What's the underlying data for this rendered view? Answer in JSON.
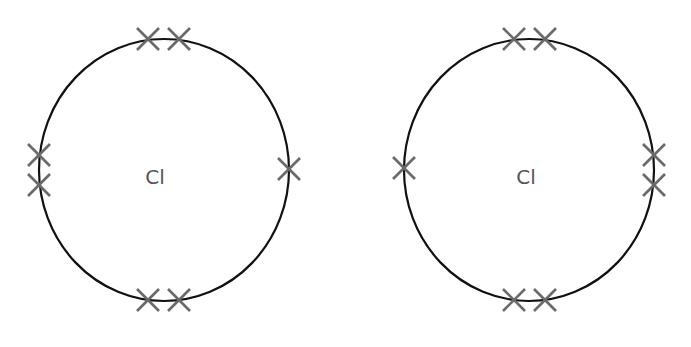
{
  "diagram": {
    "type": "dot-and-cross (electron shell) diagrams",
    "colors": {
      "shell": "#111111",
      "electron": "#6a6a6a",
      "label": "#555555",
      "background": "#ffffff"
    },
    "atoms": [
      {
        "symbol": "Cl",
        "center": [
          164,
          170
        ],
        "radius": [
          125,
          131
        ],
        "electrons": [
          {
            "position": "top",
            "x": 148,
            "y": 39
          },
          {
            "position": "top",
            "x": 179,
            "y": 39
          },
          {
            "position": "left",
            "x": 39,
            "y": 155
          },
          {
            "position": "left",
            "x": 39,
            "y": 185
          },
          {
            "position": "right",
            "x": 289,
            "y": 169
          },
          {
            "position": "bottom",
            "x": 148,
            "y": 300
          },
          {
            "position": "bottom",
            "x": 179,
            "y": 300
          }
        ]
      },
      {
        "symbol": "Cl",
        "center": [
          529,
          170
        ],
        "radius": [
          125,
          131
        ],
        "electrons": [
          {
            "position": "top",
            "x": 514,
            "y": 39
          },
          {
            "position": "top",
            "x": 545,
            "y": 39
          },
          {
            "position": "left",
            "x": 404,
            "y": 168
          },
          {
            "position": "right",
            "x": 654,
            "y": 155
          },
          {
            "position": "right",
            "x": 654,
            "y": 185
          },
          {
            "position": "bottom",
            "x": 514,
            "y": 300
          },
          {
            "position": "bottom",
            "x": 545,
            "y": 300
          }
        ]
      }
    ]
  }
}
